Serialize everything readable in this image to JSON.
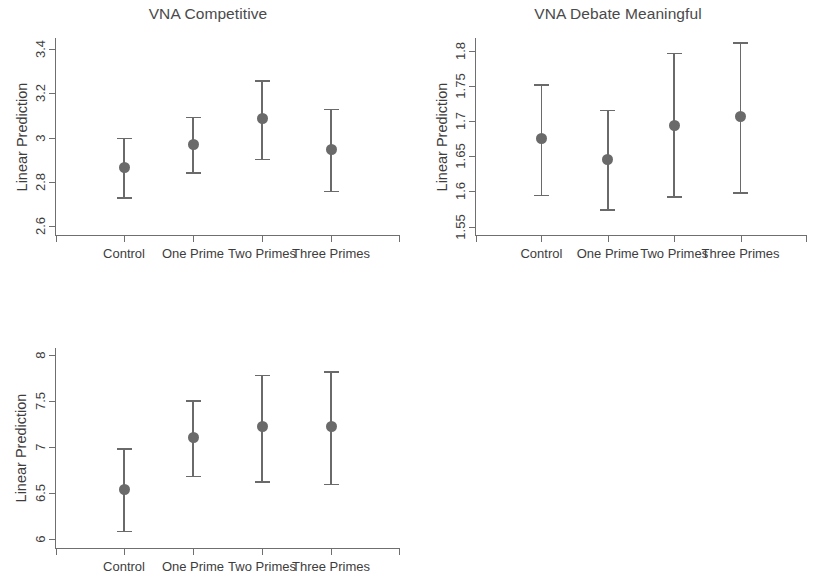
{
  "figure": {
    "background_color": "#ffffff",
    "marker_color": "#6a6a6a",
    "axis_color": "#6f6f6f",
    "text_color": "#3d3d3d"
  },
  "chart_data": [
    {
      "type": "scatter",
      "title": "VNA Competitive",
      "xlabel": "",
      "ylabel": "Linear Prediction",
      "categories": [
        "Control",
        "One Prime",
        "Two Primes",
        "Three Primes"
      ],
      "values": [
        2.865,
        2.97,
        3.085,
        2.945
      ],
      "ci_low": [
        2.73,
        2.845,
        2.905,
        2.76
      ],
      "ci_high": [
        3.0,
        3.095,
        3.26,
        3.13
      ],
      "ylim": [
        2.56,
        3.45
      ],
      "yticks": [
        2.6,
        2.8,
        3,
        3.2,
        3.4
      ],
      "ytick_labels": [
        "2.6",
        "2.8",
        "3",
        "3.2",
        "3.4"
      ],
      "grid": false,
      "legend": "none"
    },
    {
      "type": "scatter",
      "title": "VNA Debate Meaningful",
      "xlabel": "",
      "ylabel": "Linear Prediction",
      "categories": [
        "Control",
        "One Prime",
        "Two Primes",
        "Three Primes"
      ],
      "values": [
        1.675,
        1.646,
        1.694,
        1.706
      ],
      "ci_low": [
        1.595,
        1.575,
        1.593,
        1.599
      ],
      "ci_high": [
        1.752,
        1.716,
        1.797,
        1.812
      ],
      "ylim": [
        1.538,
        1.818
      ],
      "yticks": [
        1.55,
        1.6,
        1.65,
        1.7,
        1.75,
        1.8
      ],
      "ytick_labels": [
        "1.55",
        "1.6",
        "1.65",
        "1.7",
        "1.75",
        "1.8"
      ],
      "grid": false,
      "legend": "none"
    },
    {
      "type": "scatter",
      "title": "VNA Influential",
      "xlabel": "",
      "ylabel": "Linear Prediction",
      "categories": [
        "Control",
        "One Prime",
        "Two Primes",
        "Three Primes"
      ],
      "values": [
        6.54,
        7.1,
        7.22,
        7.22
      ],
      "ci_low": [
        6.09,
        6.69,
        6.63,
        6.6
      ],
      "ci_high": [
        6.99,
        7.51,
        7.79,
        7.83
      ],
      "ylim": [
        5.9,
        8.08
      ],
      "yticks": [
        6,
        6.5,
        7,
        7.5,
        8
      ],
      "ytick_labels": [
        "6",
        "6.5",
        "7",
        "7.5",
        "8"
      ],
      "grid": false,
      "legend": "none"
    }
  ],
  "panels": [
    {
      "name": "panel-vna-competitive",
      "box": {
        "left": 0,
        "top": 0,
        "width": 416,
        "height": 290
      },
      "plot": {
        "left": 55,
        "top": 38,
        "width": 345,
        "height": 197
      }
    },
    {
      "name": "panel-vna-debate-meaningful",
      "box": {
        "left": 420,
        "top": 0,
        "width": 396,
        "height": 290
      },
      "plot": {
        "left": 475,
        "top": 38,
        "width": 332,
        "height": 197
      }
    },
    {
      "name": "panel-vna-influential",
      "box": {
        "left": 0,
        "top": 295,
        "width": 416,
        "height": 290
      },
      "plot": {
        "left": 55,
        "top": 348,
        "width": 345,
        "height": 200
      }
    }
  ]
}
